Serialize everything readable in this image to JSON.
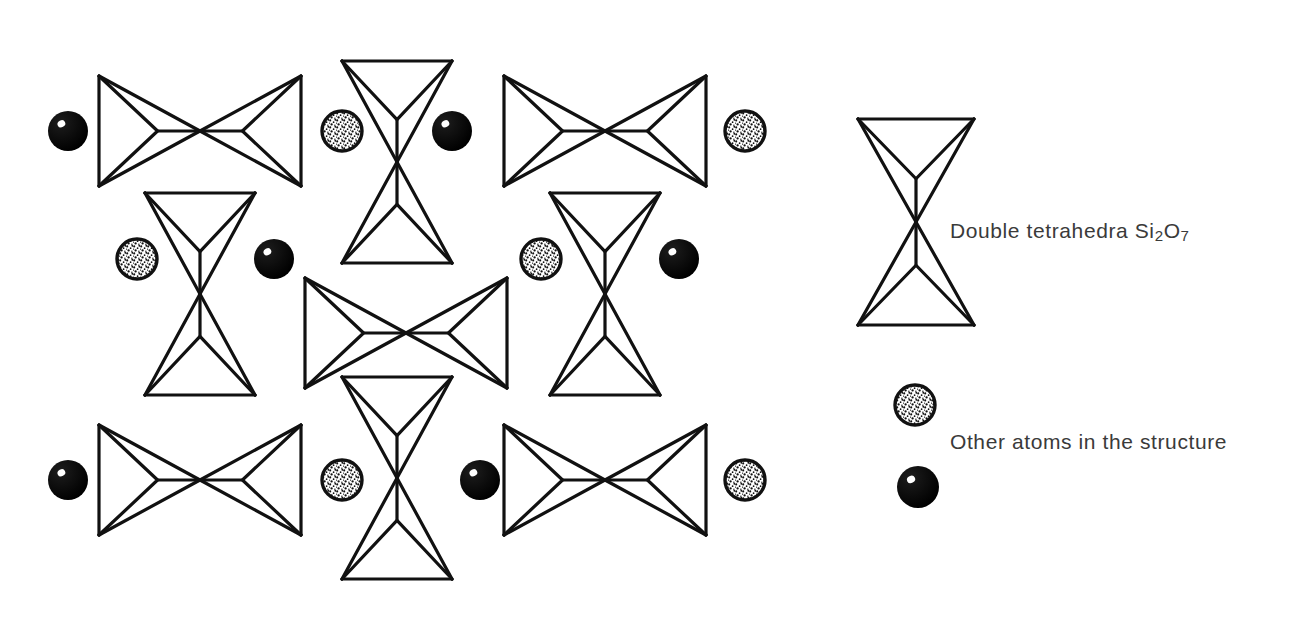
{
  "figure": {
    "background_color": "#ffffff",
    "stroke_color": "#111111",
    "width": 1301,
    "height": 635
  },
  "legend": {
    "items": [
      {
        "key": "double-tetrahedra",
        "symbol": "double-tetrahedron-vertical",
        "label_text": "Double tetrahedra Si",
        "label_sub_1": "2",
        "label_mid": "O",
        "label_sub_2": "7",
        "label_full": "Double tetrahedra Si2O7"
      },
      {
        "key": "other-atoms",
        "symbol": "stippled-circle",
        "label_full": "Other atoms in the structure"
      },
      {
        "key": "other-atoms-dark",
        "symbol": "solid-black-circle",
        "label_full": ""
      }
    ]
  },
  "atoms": {
    "stippled": {
      "fill": "#ffffff",
      "stroke": "#111111",
      "speckle_color": "#111111",
      "name": "stippled-atom"
    },
    "solid": {
      "fill": "#111111",
      "highlight": "#ffffff",
      "name": "solid-atom"
    },
    "positions": [
      {
        "id": "a1",
        "type": "solid",
        "cx": 68,
        "cy": 131,
        "r": 20
      },
      {
        "id": "a2",
        "type": "stippled",
        "cx": 342,
        "cy": 131,
        "r": 20
      },
      {
        "id": "a3",
        "type": "solid",
        "cx": 452,
        "cy": 131,
        "r": 20
      },
      {
        "id": "a4",
        "type": "stippled",
        "cx": 745,
        "cy": 131,
        "r": 20
      },
      {
        "id": "a5",
        "type": "stippled",
        "cx": 137,
        "cy": 259,
        "r": 20
      },
      {
        "id": "a6",
        "type": "solid",
        "cx": 274,
        "cy": 259,
        "r": 20
      },
      {
        "id": "a7",
        "type": "stippled",
        "cx": 541,
        "cy": 259,
        "r": 20
      },
      {
        "id": "a8",
        "type": "solid",
        "cx": 679,
        "cy": 259,
        "r": 20
      },
      {
        "id": "a9",
        "type": "solid",
        "cx": 68,
        "cy": 480,
        "r": 20
      },
      {
        "id": "a10",
        "type": "stippled",
        "cx": 342,
        "cy": 480,
        "r": 20
      },
      {
        "id": "a11",
        "type": "solid",
        "cx": 480,
        "cy": 480,
        "r": 20
      },
      {
        "id": "a12",
        "type": "stippled",
        "cx": 745,
        "cy": 480,
        "r": 20
      },
      {
        "id": "legend-stippled",
        "type": "stippled",
        "cx": 915,
        "cy": 405,
        "r": 20
      },
      {
        "id": "legend-solid",
        "type": "solid",
        "cx": 918,
        "cy": 487,
        "r": 21
      }
    ]
  },
  "tetrahedra": {
    "horizontal": [
      {
        "id": "h1",
        "cx": 200,
        "cy": 131,
        "hw": 101,
        "hh": 55
      },
      {
        "id": "h2",
        "cx": 605,
        "cy": 131,
        "hw": 101,
        "hh": 55
      },
      {
        "id": "h3",
        "cx": 406,
        "cy": 333,
        "hw": 101,
        "hh": 55
      },
      {
        "id": "h4",
        "cx": 200,
        "cy": 480,
        "hw": 101,
        "hh": 55
      },
      {
        "id": "h5",
        "cx": 605,
        "cy": 480,
        "hw": 101,
        "hh": 55
      }
    ],
    "vertical": [
      {
        "id": "v1",
        "cx": 397,
        "cy": 162,
        "hw": 55,
        "hh": 101
      },
      {
        "id": "v2",
        "cx": 200,
        "cy": 294,
        "hw": 55,
        "hh": 101
      },
      {
        "id": "v3",
        "cx": 605,
        "cy": 294,
        "hw": 55,
        "hh": 101
      },
      {
        "id": "v4",
        "cx": 397,
        "cy": 478,
        "hw": 55,
        "hh": 101
      },
      {
        "id": "legend-v",
        "cx": 916,
        "cy": 222,
        "hw": 58,
        "hh": 103
      }
    ]
  }
}
